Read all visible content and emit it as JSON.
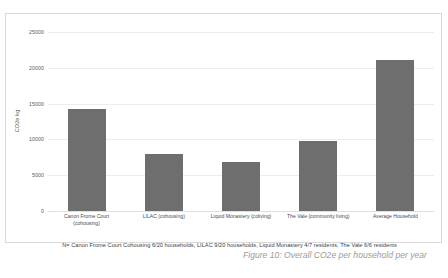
{
  "chart_data": {
    "type": "bar",
    "title": "",
    "xlabel": "",
    "ylabel": "CO2e kg",
    "ylim": [
      0,
      25000
    ],
    "yticks": [
      0,
      5000,
      10000,
      15000,
      20000,
      25000
    ],
    "ytick_labels": [
      "0",
      "5000",
      "10000",
      "15000",
      "20000",
      "25000"
    ],
    "grid": true,
    "legend": "none",
    "bar_color": "#6e6e6e",
    "categories": [
      "Canon Frome Court (cohousing)",
      "LILAC (cohousing)",
      "Liquid Monastery (coliving)",
      "The Vale (community living)",
      "Average Household"
    ],
    "category_lines": [
      [
        "Canon Frome Court",
        "(cohousing)"
      ],
      [
        "LILAC (cohousing)"
      ],
      [
        "Liquid Monastery (coliving)"
      ],
      [
        "The Vale (community living)"
      ],
      [
        "Average Household"
      ]
    ],
    "values": [
      14300,
      7900,
      6850,
      9800,
      21100
    ]
  },
  "footnote": {
    "text": "N= Canon Frome Court Cohousing 6/20 households, LILAC 9/20 households, Liquid Monastery 4/7 residents, The Vale 6/6 residents"
  },
  "caption": {
    "line1": "Figure 10: Overall CO2e per household",
    "line2": "per year"
  }
}
